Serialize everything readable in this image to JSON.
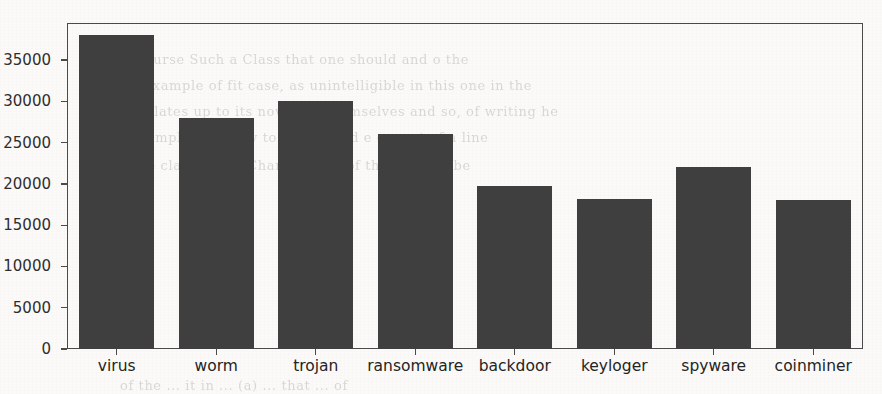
{
  "chart_data": {
    "type": "bar",
    "title": "",
    "subtitle": "",
    "xlabel": "",
    "ylabel": "",
    "categories": [
      "virus",
      "worm",
      "trojan",
      "ransomware",
      "backdoor",
      "keyloger",
      "spyware",
      "coinminer"
    ],
    "values": [
      38000,
      28000,
      30000,
      26000,
      19700,
      18200,
      22000,
      18100
    ],
    "series": [
      {
        "name": "count",
        "values": [
          38000,
          28000,
          30000,
          26000,
          19700,
          18200,
          22000,
          18100
        ]
      }
    ],
    "ylim": [
      0,
      39500
    ],
    "yticks": [
      0,
      5000,
      10000,
      15000,
      20000,
      25000,
      30000,
      35000
    ],
    "ytick_labels": [
      "0",
      "5000",
      "10000",
      "15000",
      "20000",
      "25000",
      "30000",
      "35000"
    ],
    "grid": false,
    "legend": null,
    "legend_position": "none",
    "bar_color": "#3f3f3f",
    "frame_color": "#4a4a4a",
    "background_color": "#fbfaf8",
    "annotations": []
  },
  "page_artifacts": {
    "description": "scanned page with faint bleed-through text behind the plot",
    "ghost_lines": [
      "of the  Course   Such  a  Class  that  one  should   and  o  the",
      "original  example  of  fit  case,  as  unintelligible  in  this  one  in  the",
      "which  relates  up  to  its  now  may  themselves  and  so,  of  writing  he",
      "set of  example  E  =  (x)  y  to  find  in  and  e  cannot  of  a  line",
      "when  the  class  out  of  Charm  a  sum  of  the  same  to  be"
    ],
    "ghost_lines_bottom": [
      "of  the  ...  it  in  ...  (a)  ...  that  ...  of"
    ]
  }
}
